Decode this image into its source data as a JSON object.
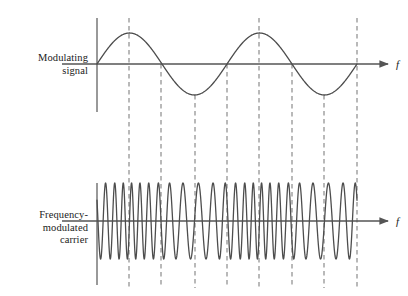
{
  "figure": {
    "background_color": "#ffffff",
    "width": 408,
    "height": 296
  },
  "labels": {
    "modulating_signal": "Modulating\nsignal",
    "frequency_modulated_carrier": "Frequency-\nmodulated\ncarrier",
    "axis_symbol_top": "f",
    "axis_symbol_bottom": "f"
  },
  "colors": {
    "curve": "#4d4d4d",
    "axis": "#555555",
    "dashed_guide": "#808080",
    "text": "#1a1a1a"
  },
  "chart_data": {
    "type": "line",
    "xlabel": "f",
    "ylabel": "",
    "grid": false,
    "legend": "none",
    "panels": [
      {
        "name": "modulating-signal",
        "label": "Modulating signal",
        "type": "line",
        "waveform": "sine",
        "cycles": 2,
        "amplitude_px": 31,
        "baseline_y": 64,
        "x_start": 97,
        "x_end": 357,
        "phase": "starts at zero rising",
        "axis_arrow_x": 392,
        "axis_symbol": "f"
      },
      {
        "name": "frequency-modulated-carrier",
        "label": "Frequency-modulated carrier",
        "type": "line",
        "waveform": "fm-carrier",
        "amplitude_px": 38,
        "baseline_y": 221,
        "x_start": 97,
        "x_end": 357,
        "carrier_cycles_approx": 24,
        "modulation_index": 0.62,
        "description": "Carrier frequency is highest where the modulating sine is at its positive peaks and lowest at its negative troughs.",
        "axis_arrow_x": 392,
        "axis_symbol": "f"
      }
    ],
    "guide_lines": {
      "count": 8,
      "style": "dashed",
      "x_positions": [
        129,
        161,
        195,
        227,
        259,
        292,
        324,
        357
      ],
      "markers": [
        "sine peak 1",
        "zero crossing falling 1",
        "sine trough 1",
        "zero crossing rising 1",
        "sine peak 2",
        "zero crossing falling 2",
        "sine trough 2",
        "zero crossing rising 2"
      ],
      "y_top": 18,
      "y_bottom": 288
    }
  }
}
